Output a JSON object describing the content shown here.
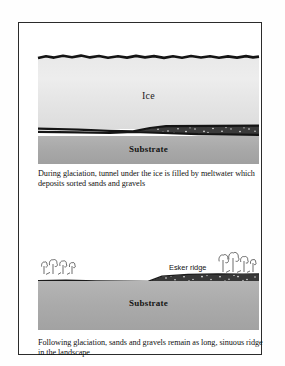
{
  "figure": {
    "panels": [
      {
        "id": "during-glaciation",
        "labels": {
          "ice": "Ice",
          "substrate": "Substrate",
          "flow": "Direction of water flow"
        },
        "caption": "During glaciation, tunnel under the ice is filled by meltwater which deposits sorted sands and gravels"
      },
      {
        "id": "following-glaciation",
        "labels": {
          "esker": "Esker ridge",
          "substrate": "Substrate"
        },
        "caption": "Following glaciation, sands and gravels remain as long, sinuous ridge in the landscape"
      }
    ]
  },
  "colors": {
    "ice_light": "#ededed",
    "ice_dark": "#dcdcdc",
    "substrate_light": "#b5b5b5",
    "substrate_dark": "#a0a0a0",
    "outline": "#111111",
    "gravel": "#2a2a2a",
    "page": "#ffffff",
    "border": "#2b2b2b"
  }
}
